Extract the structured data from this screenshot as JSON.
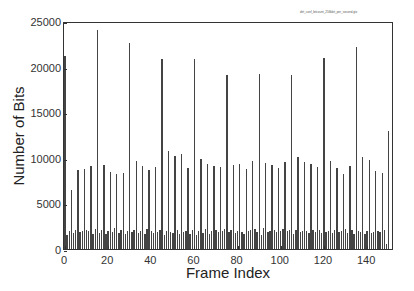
{
  "chart_data": {
    "type": "bar",
    "title": "",
    "legend": [
      "dirt_conf_bitcount_256kbit_per_second.gtx"
    ],
    "xlabel": "Frame Index",
    "ylabel": "Number of Bits",
    "xlim": [
      0,
      152
    ],
    "ylim": [
      0,
      25000
    ],
    "xticks": [
      0,
      20,
      40,
      60,
      80,
      100,
      120,
      140
    ],
    "yticks": [
      0,
      5000,
      10000,
      15000,
      20000,
      25000
    ],
    "grid": false,
    "x": [
      0,
      1,
      2,
      3,
      4,
      5,
      6,
      7,
      8,
      9,
      10,
      11,
      12,
      13,
      14,
      15,
      16,
      17,
      18,
      19,
      20,
      21,
      22,
      23,
      24,
      25,
      26,
      27,
      28,
      29,
      30,
      31,
      32,
      33,
      34,
      35,
      36,
      37,
      38,
      39,
      40,
      41,
      42,
      43,
      44,
      45,
      46,
      47,
      48,
      49,
      50,
      51,
      52,
      53,
      54,
      55,
      56,
      57,
      58,
      59,
      60,
      61,
      62,
      63,
      64,
      65,
      66,
      67,
      68,
      69,
      70,
      71,
      72,
      73,
      74,
      75,
      76,
      77,
      78,
      79,
      80,
      81,
      82,
      83,
      84,
      85,
      86,
      87,
      88,
      89,
      90,
      91,
      92,
      93,
      94,
      95,
      96,
      97,
      98,
      99,
      100,
      101,
      102,
      103,
      104,
      105,
      106,
      107,
      108,
      109,
      110,
      111,
      112,
      113,
      114,
      115,
      116,
      117,
      118,
      119,
      120,
      121,
      122,
      123,
      124,
      125,
      126,
      127,
      128,
      129,
      130,
      131,
      132,
      133,
      134,
      135,
      136,
      137,
      138,
      139,
      140,
      141,
      142,
      143,
      144,
      145,
      146,
      147,
      148,
      149,
      150
    ],
    "values": [
      21300,
      1500,
      2000,
      6500,
      1800,
      2100,
      8700,
      1900,
      2000,
      8900,
      2100,
      2000,
      9200,
      1700,
      2200,
      24200,
      1800,
      2100,
      9300,
      1700,
      2000,
      8500,
      1900,
      2300,
      8300,
      1800,
      2100,
      8400,
      1700,
      2000,
      22800,
      1900,
      2100,
      9700,
      1800,
      2000,
      9200,
      1700,
      2200,
      8700,
      2000,
      1800,
      9100,
      1900,
      2100,
      21000,
      1600,
      2000,
      10800,
      1900,
      1800,
      10300,
      2100,
      1700,
      10500,
      1900,
      2000,
      9000,
      1700,
      2100,
      21000,
      1600,
      2000,
      10000,
      1800,
      2200,
      9400,
      1700,
      2000,
      9200,
      2100,
      1900,
      9100,
      2000,
      2200,
      19300,
      1900,
      2100,
      9300,
      1800,
      2000,
      9400,
      1900,
      1700,
      8900,
      2000,
      2100,
      9700,
      2200,
      1900,
      19400,
      1600,
      2300,
      9500,
      1900,
      2000,
      9300,
      2100,
      1900,
      9000,
      2000,
      2200,
      9600,
      2000,
      2100,
      19300,
      1700,
      2100,
      10200,
      1900,
      2000,
      9600,
      2000,
      1800,
      9400,
      2100,
      1900,
      9100,
      2100,
      1800,
      21100,
      1900,
      2000,
      9700,
      1800,
      2100,
      9000,
      1900,
      2000,
      8300,
      2200,
      1800,
      9200,
      2100,
      1700,
      22300,
      2000,
      1900,
      10200,
      1700,
      2000,
      9800,
      1800,
      1900,
      8600,
      2000,
      1900,
      8400,
      2100,
      600,
      13000
    ]
  },
  "legend_text": "dirt_conf_bitcount_256kbit_per_second.gtx",
  "axes": {
    "xlabel": "Frame Index",
    "ylabel": "Number of Bits",
    "yticks": [
      "0",
      "5000",
      "10000",
      "15000",
      "20000",
      "25000"
    ],
    "xticks": [
      "0",
      "20",
      "40",
      "60",
      "80",
      "100",
      "120",
      "140"
    ]
  }
}
